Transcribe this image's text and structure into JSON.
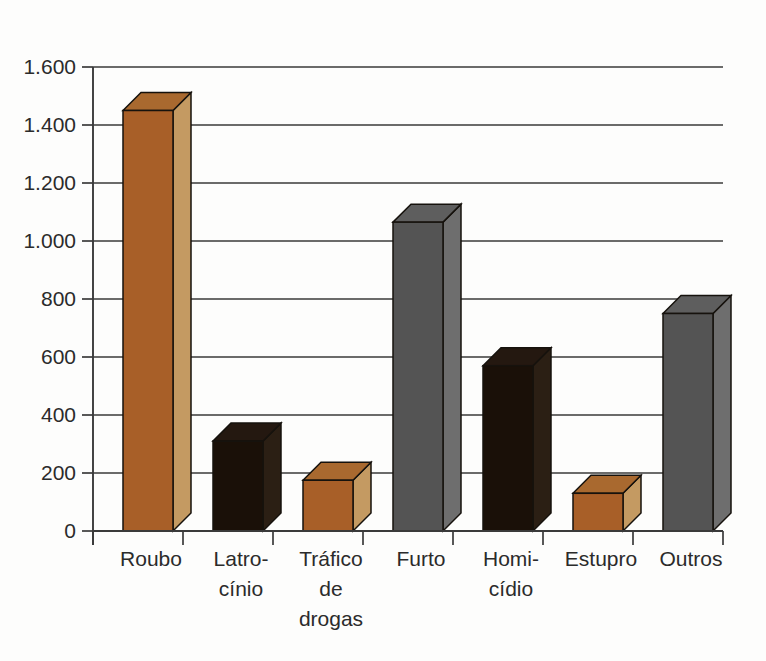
{
  "chart_data": {
    "type": "bar",
    "title": "",
    "subtitle": "",
    "xlabel": "",
    "ylabel": "",
    "categories": [
      "Roubo",
      "Latro-\ncínio",
      "Tráfico\nde\ndrogas",
      "Furto",
      "Homi-\ncídio",
      "Estupro",
      "Outros"
    ],
    "category_lines": [
      [
        "Roubo"
      ],
      [
        "Latro-",
        "cínio"
      ],
      [
        "Tráfico",
        "de",
        "drogas"
      ],
      [
        "Furto"
      ],
      [
        "Homi-",
        "cídio"
      ],
      [
        "Estupro"
      ],
      [
        "Outros"
      ]
    ],
    "values": [
      1450,
      310,
      175,
      1065,
      570,
      130,
      750
    ],
    "bar_colors": [
      "orange",
      "black",
      "orange",
      "gray",
      "black",
      "orange",
      "gray"
    ],
    "ylim": [
      0,
      1600
    ],
    "yticks": [
      0,
      200,
      400,
      600,
      800,
      1000,
      1200,
      1400,
      1600
    ],
    "ytick_labels": [
      "0",
      "200",
      "400",
      "600",
      "800",
      "1.000",
      "1.200",
      "1.400",
      "1.600"
    ],
    "grid": true,
    "legend": "none",
    "style": "3d-isometric-bars"
  },
  "palette": {
    "orange_front": "#A85F28",
    "orange_side": "#C49A62",
    "orange_top": "#A9692F",
    "black_front": "#1A1008",
    "black_side": "#2B1F14",
    "black_top": "#241810",
    "gray_front": "#545454",
    "gray_side": "#6E6E6E",
    "gray_top": "#5E5E5E",
    "outline": "#16120D",
    "axis": "#3A3A3A",
    "background": "#FDFDFC",
    "text": "#2B2B2B"
  },
  "geometry": {
    "baseline_y": 531,
    "axis_x": 93,
    "grid_right_x": 723,
    "px_per_200": 58,
    "bar_width": 50,
    "depth_x": 18,
    "depth_y": 18,
    "bar_front_left_x": [
      123,
      213,
      303,
      393,
      483,
      573,
      663
    ]
  }
}
